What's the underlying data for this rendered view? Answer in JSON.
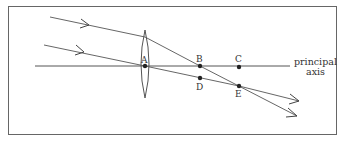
{
  "diagram": {
    "type": "ray diagram - converging lens",
    "frame": {
      "x": 8,
      "y": 6,
      "w": 329,
      "h": 129
    },
    "axis": {
      "x1": 35,
      "x2": 290,
      "y": 66,
      "label_line1": "principal",
      "label_line2": "axis"
    },
    "lens": {
      "cx": 145,
      "top": 30,
      "bottom": 98,
      "half_width": 5
    },
    "points": [
      {
        "id": "A",
        "label": "A",
        "x": 145,
        "y": 66
      },
      {
        "id": "B",
        "label": "B",
        "x": 200,
        "y": 66
      },
      {
        "id": "C",
        "label": "C",
        "x": 239,
        "y": 67
      },
      {
        "id": "D",
        "label": "D",
        "x": 200,
        "y": 78
      },
      {
        "id": "E",
        "label": "E",
        "x": 239,
        "y": 86
      }
    ],
    "rays": [
      {
        "name": "ray-1",
        "from": [
          50,
          17
        ],
        "via": [
          145,
          37
        ],
        "to": [
          297,
          116
        ]
      },
      {
        "name": "ray-2",
        "from": [
          44,
          45
        ],
        "via": [
          145,
          66
        ],
        "to": [
          299,
          101
        ]
      }
    ],
    "colors": {
      "line": "#555555",
      "dot": "#222222",
      "frame": "#666666"
    }
  }
}
